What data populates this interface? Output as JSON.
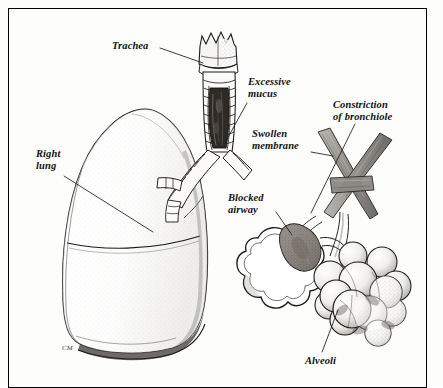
{
  "figure": {
    "background_color": "#fdfdfc",
    "ink_color": "#111111",
    "frame_color": "#000000",
    "style": "pen-and-ink stippled medical illustration"
  },
  "labels": [
    {
      "id": "trachea",
      "text": "Trachea",
      "x": 112,
      "y": 40,
      "align": "left"
    },
    {
      "id": "excessive-mucus",
      "text": "Excessive\nmucus",
      "x": 248,
      "y": 76,
      "align": "left"
    },
    {
      "id": "constriction",
      "text": "Constriction\nof bronchiole",
      "x": 333,
      "y": 99,
      "align": "left"
    },
    {
      "id": "swollen-membrane",
      "text": "Swollen\nmembrane",
      "x": 252,
      "y": 128,
      "align": "left"
    },
    {
      "id": "right-lung",
      "text": "Right\nlung",
      "x": 36,
      "y": 148,
      "align": "left"
    },
    {
      "id": "blocked-airway",
      "text": "Blocked\nairway",
      "x": 228,
      "y": 192,
      "align": "left"
    },
    {
      "id": "alveoli",
      "text": "Alveoli",
      "x": 305,
      "y": 355,
      "align": "left"
    }
  ],
  "leader_lines": [
    {
      "id": "trachea-leader",
      "from": [
        160,
        48
      ],
      "to": [
        203,
        63
      ]
    },
    {
      "id": "excessive-mucus-leader",
      "from": [
        247,
        103
      ],
      "to": [
        226,
        141
      ]
    },
    {
      "id": "constriction-leader",
      "from": [
        355,
        124
      ],
      "to": [
        311,
        213
      ]
    },
    {
      "id": "swollen-membrane-leader",
      "from": [
        311,
        152
      ],
      "to": [
        333,
        156
      ]
    },
    {
      "id": "right-lung-leader",
      "from": [
        64,
        176
      ],
      "to": [
        153,
        232
      ]
    },
    {
      "id": "blocked-airway-leader",
      "from": [
        276,
        212
      ],
      "to": [
        292,
        235
      ]
    },
    {
      "id": "alveoli-leader",
      "from": [
        322,
        352
      ],
      "to": [
        338,
        310
      ]
    }
  ],
  "anatomy": [
    {
      "id": "larynx",
      "name": "larynx",
      "description": "crown-shaped notched cartilage at top of trachea"
    },
    {
      "id": "trachea-tube",
      "name": "trachea",
      "description": "vertical tube with horizontal cartilage rings"
    },
    {
      "id": "mucus-plug-trachea",
      "name": "excessive-mucus",
      "description": "dark mucus filling the tracheal lumen",
      "color": "#2b2721"
    },
    {
      "id": "bronchi",
      "name": "bronchi",
      "description": "two banded branches splitting from the trachea"
    },
    {
      "id": "right-lung-body",
      "name": "right-lung",
      "description": "large stippled lung with oblique fissure"
    },
    {
      "id": "bronchioles",
      "name": "constricted-bronchioles",
      "description": "two crossed gray tubes narrowing downward",
      "color": "#8d8a86"
    },
    {
      "id": "alveolar-sac",
      "name": "blocked-alveolar-sac",
      "description": "scalloped flower-shaped open sac"
    },
    {
      "id": "mucus-plug-airway",
      "name": "blocked-airway",
      "description": "dark mucus plug blocking the sac inlet",
      "color": "#5d5650"
    },
    {
      "id": "alveoli-cluster",
      "name": "alveoli",
      "description": "cluster of twelve overlapping stippled spheres"
    }
  ],
  "signature": {
    "text": "CM",
    "x": 62,
    "y": 344
  }
}
